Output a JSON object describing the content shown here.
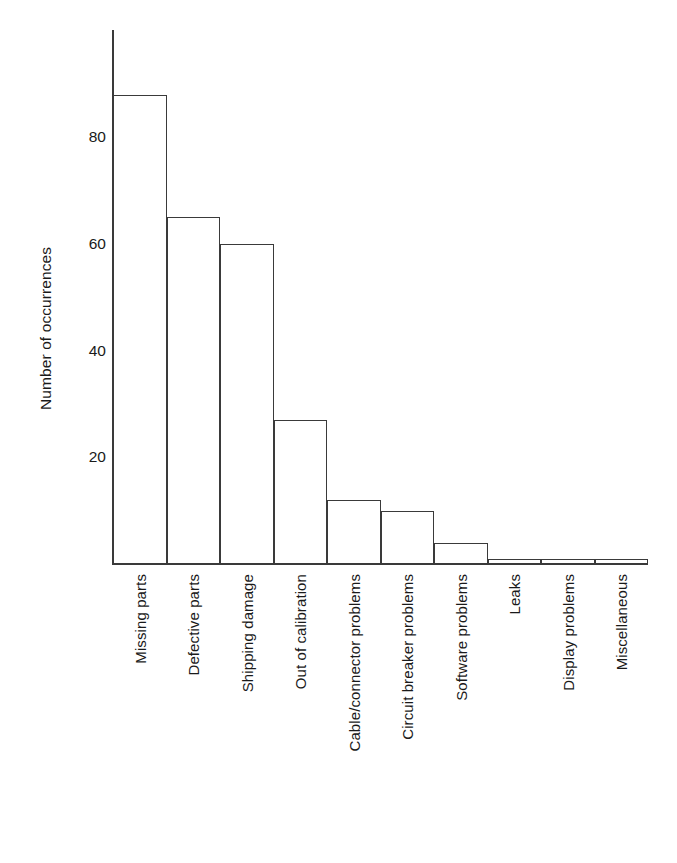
{
  "chart_data": {
    "type": "bar",
    "title": "",
    "subtitle": "",
    "xlabel": "",
    "ylabel": "Number of occurrences",
    "categories": [
      "Missing parts",
      "Defective parts",
      "Shipping damage",
      "Out of calibration",
      "Cable/connector problems",
      "Circuit breaker problems",
      "Software problems",
      "Leaks",
      "Display problems",
      "Miscellaneous"
    ],
    "values": [
      88,
      65,
      60,
      27,
      12,
      10,
      4,
      1,
      1,
      1
    ],
    "ylim": [
      0,
      100
    ],
    "yticks": [
      20,
      40,
      60,
      80
    ],
    "ytick_labels": [
      "20",
      "40",
      "60",
      "80"
    ],
    "grid": false,
    "legend": false,
    "legend_position": "none",
    "bar_fill_color": "#ffffff",
    "bar_edge_color": "#3a3a3a",
    "axis_color": "#3a3a3a",
    "background_color": "#ffffff",
    "text_color": "#1a1a1a",
    "annotations": []
  }
}
